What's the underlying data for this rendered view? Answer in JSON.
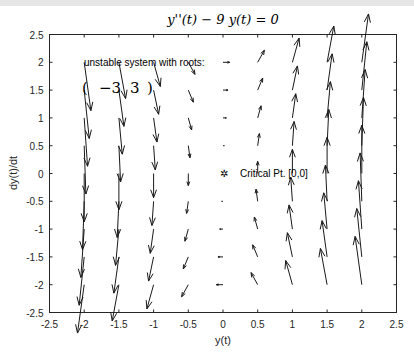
{
  "chart_data": {
    "type": "quiver",
    "title": "y''(t) − 9 y(t) = 0",
    "xlabel": "y(t)",
    "ylabel": "dy(t)/dt",
    "xlim": [
      -2.5,
      2.5
    ],
    "ylim": [
      -2.5,
      2.5
    ],
    "xticks": [
      "-2.5",
      "-2",
      "-1.5",
      "-1",
      "-0.5",
      "0",
      "0.5",
      "1",
      "1.5",
      "2",
      "2.5"
    ],
    "yticks": [
      "2.5",
      "2",
      "1.5",
      "1",
      "0.5",
      "0",
      "-0.5",
      "-1",
      "-1.5",
      "-2",
      "-2.5"
    ],
    "grid": false,
    "field": {
      "equation": "y' = v, v' = 9 y",
      "x_grid": [
        -2,
        -1.5,
        -1,
        -0.5,
        0,
        0.5,
        1,
        1.5,
        2
      ],
      "y_grid": [
        -2,
        -1.5,
        -1,
        -0.5,
        0,
        0.5,
        1,
        1.5,
        2
      ],
      "coefficient": 9
    },
    "annotations": {
      "system_text": "unstable system with roots:",
      "roots_open": "(",
      "roots": [
        "−3",
        "3"
      ],
      "roots_close": ")",
      "critical_point_label": "Critical Pt.  [0,0]",
      "critical_point_marker": "✲"
    },
    "colors": {
      "arrow": "#1a1a1a",
      "axes": "#262626"
    }
  }
}
